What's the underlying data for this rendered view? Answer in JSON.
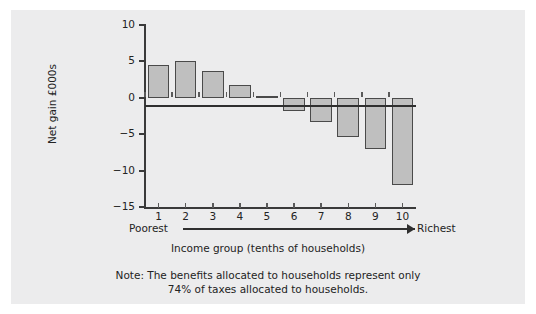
{
  "chart_data": {
    "type": "bar",
    "title": "",
    "xlabel": "Income group (tenths of households)",
    "ylabel": "Net gain £000s",
    "categories": [
      "1",
      "2",
      "3",
      "4",
      "5",
      "6",
      "7",
      "8",
      "9",
      "10"
    ],
    "values": [
      4.5,
      5.0,
      3.7,
      1.7,
      0.3,
      -1.8,
      -3.3,
      -5.4,
      -7.0,
      -12.0
    ],
    "ylim": [
      -15,
      10
    ],
    "yticks": [
      10,
      5,
      0,
      -5,
      -10,
      -15
    ],
    "ytick_labels": [
      "10",
      "5",
      "0",
      "−5",
      "−10",
      "−15"
    ],
    "grid": false,
    "legend": null,
    "bar_color": "#bfbfbf",
    "bar_edge_color": "#4a4a4a",
    "axis_color": "#3a3a3a",
    "background_color": "#ececed",
    "annotations": {
      "range_low": "Poorest",
      "range_high": "Richest",
      "note_line1": "Note: The benefits allocated to households represent only",
      "note_line2": "74% of taxes allocated to households."
    }
  }
}
